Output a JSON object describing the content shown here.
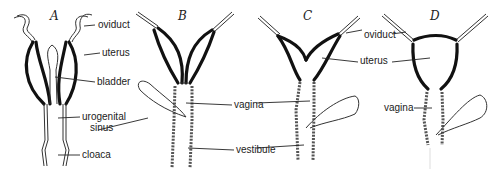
{
  "figure": {
    "panels": [
      {
        "id": "A",
        "label": "A",
        "labels": {
          "oviduct": "oviduct",
          "uterus": "uterus",
          "bladder": "bladder",
          "urogenital_sinus_1": "urogenital",
          "urogenital_sinus_2": "sinus",
          "cloaca": "cloaca"
        }
      },
      {
        "id": "B",
        "label": "B",
        "labels": {
          "vagina": "vagina",
          "vestibule": "vestibule"
        }
      },
      {
        "id": "C",
        "label": "C",
        "labels": {
          "oviduct": "oviduct",
          "uterus": "uterus"
        }
      },
      {
        "id": "D",
        "label": "D",
        "labels": {
          "vagina": "vagina"
        }
      }
    ]
  }
}
